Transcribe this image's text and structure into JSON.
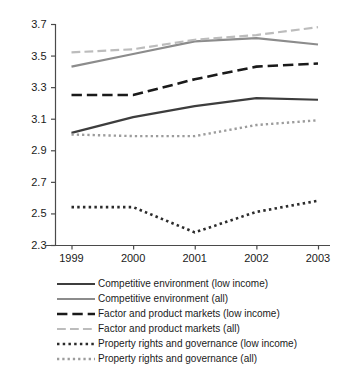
{
  "chart_data": {
    "type": "line",
    "title": "",
    "subtitle": "",
    "xlabel": "",
    "ylabel": "",
    "categories": [
      "1999",
      "2000",
      "2001",
      "2002",
      "2003"
    ],
    "x_tick_labels": [
      "1999",
      "2000",
      "2001",
      "2002",
      "2003"
    ],
    "y_tick_labels": [
      "2.3",
      "2.5",
      "2.7",
      "2.9",
      "3.1",
      "3.3",
      "3.5",
      "3.7"
    ],
    "y_ticks": [
      2.3,
      2.5,
      2.7,
      2.9,
      3.1,
      3.3,
      3.5,
      3.7
    ],
    "ylim": [
      2.3,
      3.7
    ],
    "grid": false,
    "legend_position": "bottom",
    "series": [
      {
        "name": "Competitive environment (low income)",
        "values": [
          3.01,
          3.11,
          3.18,
          3.23,
          3.22
        ],
        "color": "#3d3d3d",
        "style": "solid",
        "width": 2.2
      },
      {
        "name": "Competitive environment (all)",
        "values": [
          3.43,
          3.51,
          3.59,
          3.61,
          3.57
        ],
        "color": "#8c8c8c",
        "style": "solid",
        "width": 2.2
      },
      {
        "name": "Factor and product markets (low income)",
        "values": [
          3.25,
          3.25,
          3.35,
          3.43,
          3.45
        ],
        "color": "#1a1a1a",
        "style": "dashed",
        "width": 2.6
      },
      {
        "name": "Factor and product markets (all)",
        "values": [
          3.52,
          3.54,
          3.6,
          3.63,
          3.68
        ],
        "color": "#bcbcbc",
        "style": "dashed",
        "width": 2.2
      },
      {
        "name": "Property rights and governance (low income)",
        "values": [
          2.54,
          2.54,
          2.38,
          2.51,
          2.58
        ],
        "color": "#2b2b2b",
        "style": "dotted",
        "width": 2.6
      },
      {
        "name": "Property rights and governance (all)",
        "values": [
          3.0,
          2.99,
          2.99,
          3.06,
          3.09
        ],
        "color": "#9c9c9c",
        "style": "dotted",
        "width": 2.4
      }
    ]
  },
  "legend": {
    "entries": [
      {
        "label": "Competitive environment (low income)"
      },
      {
        "label": "Competitive environment (all)"
      },
      {
        "label": "Factor and product markets (low income)"
      },
      {
        "label": "Factor and product markets (all)"
      },
      {
        "label": "Property rights and governance (low income)"
      },
      {
        "label": "Property rights and governance (all)"
      }
    ]
  }
}
